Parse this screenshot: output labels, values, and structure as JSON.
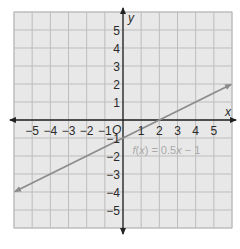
{
  "chart_data": {
    "type": "line",
    "title": "",
    "xlabel": "x",
    "ylabel": "y",
    "xlim": [
      -6,
      6
    ],
    "ylim": [
      -6,
      6
    ],
    "grid": true,
    "origin_label": "O",
    "x_ticks": [
      -5,
      -4,
      -3,
      -2,
      -1,
      1,
      2,
      3,
      4,
      5
    ],
    "x_tick_labels": [
      "−5",
      "−4",
      "−3",
      "−2",
      "−1",
      "1",
      "2",
      "3",
      "4",
      "5"
    ],
    "y_ticks": [
      5,
      4,
      3,
      2,
      1,
      -1,
      -2,
      -3,
      -4,
      -5
    ],
    "y_tick_labels": [
      "5",
      "4",
      "3",
      "2",
      "1",
      "−1",
      "−2",
      "−3",
      "−4",
      "−5"
    ],
    "series": [
      {
        "name": "f(x) = 0.5x − 1",
        "equation": "f(x) = 0.5x - 1",
        "slope": 0.5,
        "intercept": -1,
        "x": [
          -6,
          -4,
          -2,
          0,
          2,
          4,
          6
        ],
        "y": [
          -4,
          -3,
          -2,
          -1,
          0,
          1,
          2
        ],
        "arrows": "both"
      }
    ],
    "annotations": [
      {
        "text_parts": [
          "f",
          "(",
          "x",
          ") = 0.5",
          "x",
          " − 1"
        ],
        "x": 0.3,
        "y": -1.6
      }
    ],
    "colors": {
      "background": "#e8e8e8",
      "gridline": "#bdbdbd",
      "axis": "#222222",
      "function_line": "#8c8c8c",
      "function_label": "#a8a8a8"
    }
  }
}
